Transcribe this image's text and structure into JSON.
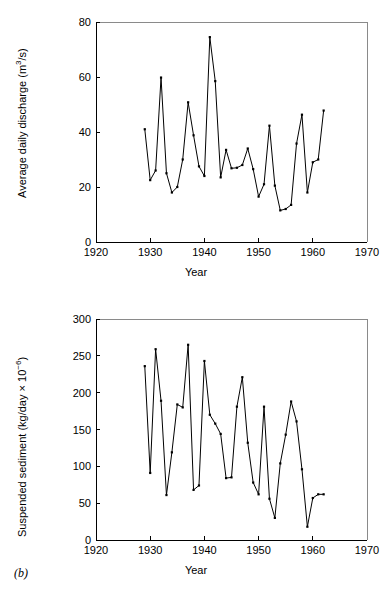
{
  "figure": {
    "panel_label": "(b)",
    "background": "#ffffff",
    "line_color": "#000000"
  },
  "panel_a": {
    "xlabel": "Year",
    "ylabel_text": "Average daily discharge (m",
    "ylabel_sup": "3",
    "ylabel_tail": "/s)"
  },
  "panel_b": {
    "xlabel": "Year",
    "ylabel_text": "Suspended sediment (kg/day × 10",
    "ylabel_sup": "−6",
    "ylabel_tail": ")"
  },
  "chart_data": [
    {
      "id": "discharge",
      "type": "line",
      "title": "",
      "xlabel": "Year",
      "ylabel": "Average daily discharge (m^3/s)",
      "xlim": [
        1920,
        1970
      ],
      "ylim": [
        0,
        80
      ],
      "xticks": [
        1920,
        1930,
        1940,
        1950,
        1960,
        1970
      ],
      "yticks": [
        0,
        20,
        40,
        60,
        80
      ],
      "xtick_labels": [
        "1920",
        "1930",
        "1940",
        "1950",
        "1960",
        "1970"
      ],
      "ytick_labels": [
        "0",
        "20",
        "40",
        "60",
        "80"
      ],
      "grid": false,
      "legend": null,
      "markers": true,
      "x": [
        1929,
        1930,
        1931,
        1932,
        1933,
        1934,
        1935,
        1936,
        1937,
        1938,
        1939,
        1940,
        1941,
        1942,
        1943,
        1944,
        1945,
        1946,
        1947,
        1948,
        1949,
        1950,
        1951,
        1952,
        1953,
        1954,
        1955,
        1956,
        1957,
        1958,
        1959,
        1960,
        1961,
        1962
      ],
      "values": [
        41.0,
        22.5,
        26.0,
        59.8,
        25.0,
        18.0,
        20.0,
        30.0,
        50.8,
        38.8,
        27.5,
        24.0,
        74.5,
        58.5,
        23.5,
        33.5,
        26.8,
        27.0,
        28.0,
        34.0,
        26.5,
        16.5,
        21.0,
        42.3,
        20.5,
        11.5,
        12.0,
        13.5,
        35.8,
        46.3,
        18.0,
        29.0,
        30.0,
        47.8
      ]
    },
    {
      "id": "sediment",
      "type": "line",
      "title": "",
      "xlabel": "Year",
      "ylabel": "Suspended sediment (kg/day x 10^-6)",
      "xlim": [
        1920,
        1970
      ],
      "ylim": [
        0,
        300
      ],
      "xticks": [
        1920,
        1930,
        1940,
        1950,
        1960,
        1970
      ],
      "yticks": [
        0,
        50,
        100,
        150,
        200,
        250,
        300
      ],
      "xtick_labels": [
        "1920",
        "1930",
        "1940",
        "1950",
        "1960",
        "1970"
      ],
      "ytick_labels": [
        "0",
        "50",
        "100",
        "150",
        "200",
        "250",
        "300"
      ],
      "grid": false,
      "legend": null,
      "markers": true,
      "x": [
        1929,
        1930,
        1931,
        1932,
        1933,
        1934,
        1935,
        1936,
        1937,
        1938,
        1939,
        1940,
        1941,
        1942,
        1943,
        1944,
        1945,
        1946,
        1947,
        1948,
        1949,
        1950,
        1951,
        1952,
        1953,
        1954,
        1955,
        1956,
        1957,
        1958,
        1959,
        1960,
        1961,
        1962
      ],
      "values": [
        236,
        91,
        259,
        189,
        61,
        119,
        184,
        180,
        265,
        68,
        74,
        243,
        170,
        158,
        144,
        84,
        85,
        181,
        221,
        132,
        78,
        62,
        181,
        56,
        30,
        104,
        143,
        188,
        161,
        96,
        18,
        57,
        62,
        62
      ]
    }
  ]
}
